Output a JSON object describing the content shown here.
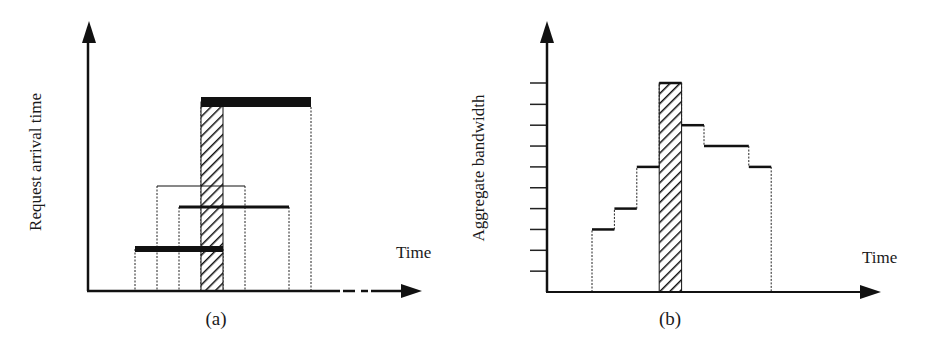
{
  "figure": {
    "type": "two-panel timing diagram",
    "colors": {
      "ink": "#111111",
      "hatch": "#111111",
      "background": "#ffffff"
    }
  },
  "panel_a": {
    "caption": "(a)",
    "y_axis_label": "Request arrival time",
    "x_axis_label": "Time",
    "x_axis_continues_dashed": true,
    "highlight_interval": {
      "start": 5,
      "end": 6,
      "pattern": "hatched"
    },
    "requests": [
      {
        "arrival": 2,
        "start": 2,
        "end": 6,
        "line_style": "thick"
      },
      {
        "arrival": 5,
        "start": 3,
        "end": 7,
        "line_style": "thin"
      },
      {
        "arrival": 4,
        "start": 4,
        "end": 9,
        "line_style": "medium"
      },
      {
        "arrival": 9,
        "start": 5,
        "end": 10,
        "line_style": "thick"
      }
    ]
  },
  "panel_b": {
    "caption": "(b)",
    "y_axis_label": "Aggregate bandwidth",
    "x_axis_label": "Time",
    "y_tick_count": 10,
    "highlight_interval": {
      "start": 5,
      "end": 6,
      "pattern": "hatched"
    },
    "steps": [
      {
        "start": 2,
        "end": 3,
        "level": 3
      },
      {
        "start": 3,
        "end": 4,
        "level": 4
      },
      {
        "start": 4,
        "end": 5,
        "level": 6
      },
      {
        "start": 5,
        "end": 6,
        "level": 10
      },
      {
        "start": 6,
        "end": 7,
        "level": 8
      },
      {
        "start": 7,
        "end": 9,
        "level": 7
      },
      {
        "start": 9,
        "end": 10,
        "level": 6
      }
    ]
  }
}
